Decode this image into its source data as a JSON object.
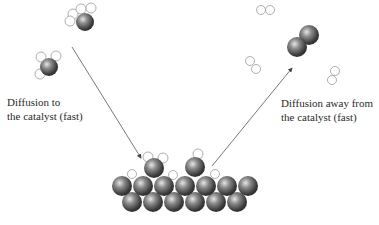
{
  "diagram": {
    "labels": {
      "diffusion_to": {
        "line1": "Diffusion to",
        "line2": "the catalyst (fast)"
      },
      "diffusion_away": {
        "line1": "Diffusion away from",
        "line2": "the catalyst (fast)"
      }
    },
    "legend_implicit": {
      "dark_sphere": "carbon / catalyst metal atom",
      "open_circle": "hydrogen atom"
    },
    "colors": {
      "arrow": "#444444",
      "atom_dark": "#3a3a3a",
      "atom_highlight": "#d9d9d9",
      "hydrogen_stroke": "#9a9a9a",
      "text": "#2a2a2a"
    }
  }
}
